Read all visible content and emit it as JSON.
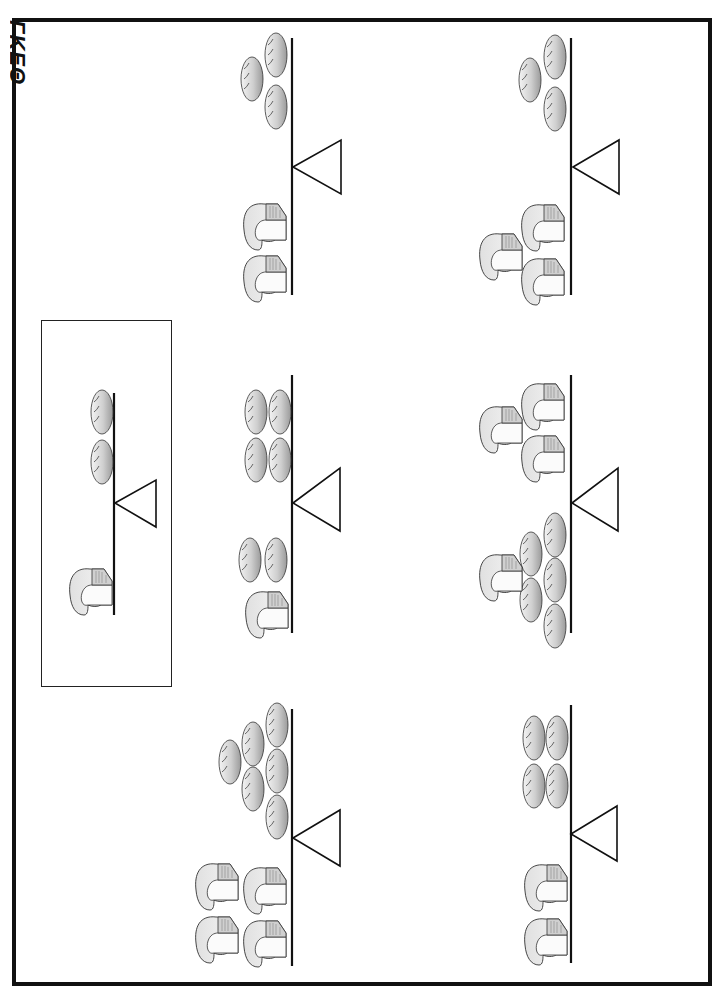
{
  "worksheet": {
    "title_fragment": "ΓΚΕΘ",
    "orientation": "rotated 90° clockwise",
    "colors": {
      "ink": "#111111",
      "bun_fill": "#d9d9d9",
      "loaf_fill": "#e8e8e8"
    }
  },
  "example": {
    "label": "example",
    "scale": {
      "beam": {
        "x": 114,
        "y1": 393,
        "y2": 615
      },
      "fulcrum": {
        "apex": [
          115,
          503
        ],
        "base_x": 156,
        "base_y1": 480,
        "base_y2": 527
      }
    },
    "items": [
      {
        "type": "bun",
        "x": 91,
        "y": 390
      },
      {
        "type": "bun",
        "x": 91,
        "y": 440
      },
      {
        "type": "loaf",
        "x": 68,
        "y": 565
      }
    ]
  },
  "scales": [
    {
      "id": 1,
      "beam": {
        "x": 292,
        "y1": 38,
        "y2": 295
      },
      "fulcrum": {
        "apex": [
          293,
          167
        ],
        "base_x": 341,
        "base_y1": 140,
        "base_y2": 194
      },
      "items": [
        {
          "type": "bun",
          "x": 265,
          "y": 33
        },
        {
          "type": "bun",
          "x": 241,
          "y": 57
        },
        {
          "type": "bun",
          "x": 265,
          "y": 85
        },
        {
          "type": "loaf",
          "x": 242,
          "y": 200
        },
        {
          "type": "loaf",
          "x": 242,
          "y": 252
        }
      ]
    },
    {
      "id": 2,
      "beam": {
        "x": 571,
        "y1": 38,
        "y2": 295
      },
      "fulcrum": {
        "apex": [
          573,
          167
        ],
        "base_x": 619,
        "base_y1": 140,
        "base_y2": 194
      },
      "items": [
        {
          "type": "bun",
          "x": 544,
          "y": 35
        },
        {
          "type": "bun",
          "x": 519,
          "y": 58
        },
        {
          "type": "bun",
          "x": 544,
          "y": 87
        },
        {
          "type": "loaf",
          "x": 520,
          "y": 201
        },
        {
          "type": "loaf",
          "x": 478,
          "y": 230
        },
        {
          "type": "loaf",
          "x": 520,
          "y": 255
        }
      ]
    },
    {
      "id": 3,
      "beam": {
        "x": 292,
        "y1": 375,
        "y2": 633
      },
      "fulcrum": {
        "apex": [
          293,
          503
        ],
        "base_x": 340,
        "base_y1": 468,
        "base_y2": 531
      },
      "items": [
        {
          "type": "bun",
          "x": 245,
          "y": 390
        },
        {
          "type": "bun",
          "x": 269,
          "y": 390
        },
        {
          "type": "bun",
          "x": 245,
          "y": 438
        },
        {
          "type": "bun",
          "x": 269,
          "y": 438
        },
        {
          "type": "bun",
          "x": 239,
          "y": 538
        },
        {
          "type": "bun",
          "x": 265,
          "y": 538
        },
        {
          "type": "loaf",
          "x": 244,
          "y": 588
        }
      ]
    },
    {
      "id": 4,
      "beam": {
        "x": 571,
        "y1": 375,
        "y2": 633
      },
      "fulcrum": {
        "apex": [
          572,
          503
        ],
        "base_x": 618,
        "base_y1": 468,
        "base_y2": 531
      },
      "items": [
        {
          "type": "loaf",
          "x": 520,
          "y": 380
        },
        {
          "type": "loaf",
          "x": 478,
          "y": 403
        },
        {
          "type": "loaf",
          "x": 520,
          "y": 432
        },
        {
          "type": "bun",
          "x": 544,
          "y": 513
        },
        {
          "type": "bun",
          "x": 520,
          "y": 532
        },
        {
          "type": "bun",
          "x": 544,
          "y": 558
        },
        {
          "type": "bun",
          "x": 520,
          "y": 578
        },
        {
          "type": "bun",
          "x": 544,
          "y": 604
        },
        {
          "type": "loaf",
          "x": 478,
          "y": 551
        }
      ]
    },
    {
      "id": 5,
      "beam": {
        "x": 292,
        "y1": 709,
        "y2": 966
      },
      "fulcrum": {
        "apex": [
          293,
          838
        ],
        "base_x": 340,
        "base_y1": 810,
        "base_y2": 866
      },
      "items": [
        {
          "type": "bun",
          "x": 266,
          "y": 703
        },
        {
          "type": "bun",
          "x": 242,
          "y": 722
        },
        {
          "type": "bun",
          "x": 219,
          "y": 740
        },
        {
          "type": "bun",
          "x": 266,
          "y": 749
        },
        {
          "type": "bun",
          "x": 242,
          "y": 767
        },
        {
          "type": "bun",
          "x": 266,
          "y": 795
        },
        {
          "type": "loaf",
          "x": 194,
          "y": 860
        },
        {
          "type": "loaf",
          "x": 242,
          "y": 864
        },
        {
          "type": "loaf",
          "x": 194,
          "y": 913
        },
        {
          "type": "loaf",
          "x": 242,
          "y": 917
        }
      ]
    },
    {
      "id": 6,
      "beam": {
        "x": 571,
        "y1": 705,
        "y2": 963
      },
      "fulcrum": {
        "apex": [
          571,
          834
        ],
        "base_x": 617,
        "base_y1": 806,
        "base_y2": 861
      },
      "items": [
        {
          "type": "bun",
          "x": 523,
          "y": 716
        },
        {
          "type": "bun",
          "x": 546,
          "y": 716
        },
        {
          "type": "bun",
          "x": 523,
          "y": 764
        },
        {
          "type": "bun",
          "x": 546,
          "y": 764
        },
        {
          "type": "loaf",
          "x": 523,
          "y": 861
        },
        {
          "type": "loaf",
          "x": 523,
          "y": 915
        }
      ]
    }
  ]
}
